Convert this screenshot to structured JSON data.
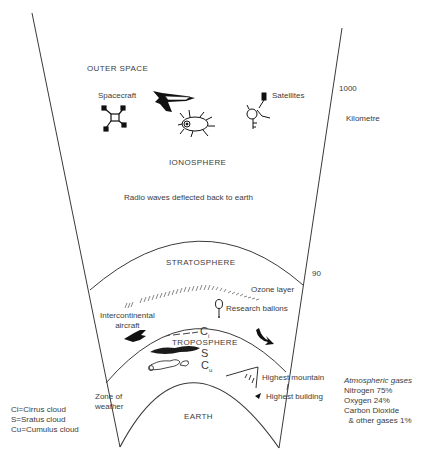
{
  "layers": {
    "outer_space": "OUTER SPACE",
    "ionosphere": "IONOSPHERE",
    "ionosphere_note": "Radio waves deflected back to earth",
    "stratosphere": "STRATOSPHERE",
    "troposphere": "TROPOSPHERE",
    "earth": "EARTH"
  },
  "objects": {
    "spacecraft": "Spacecraft",
    "satellites": "Satellites",
    "ozone_layer": "Ozone layer",
    "research_balloons": "Research ballons",
    "intercontinental_aircraft": "Intercontinental\naircraft",
    "highest_mountain": "Highest mountain",
    "highest_building": "Highest building",
    "zone_of_weather": "Zone of\nweather"
  },
  "clouds": {
    "cirrus_symbol": "C",
    "cirrus_sub": "i",
    "stratus_symbol": "S",
    "cumulus_symbol": "C",
    "cumulus_sub": "u"
  },
  "scale": {
    "top_value": "1000",
    "unit": "Kilometre",
    "stratosphere_value": "90"
  },
  "legend": {
    "items": [
      "Ci=Cirrus cloud",
      "S=Sratus cloud",
      "Cu=Cumulus cloud"
    ]
  },
  "gases": {
    "title": "Atmospheric gases",
    "items": [
      "Nitrogen 75%",
      "Oxygen 24%",
      "Carbon Dioxide",
      "  & other gases 1%"
    ]
  },
  "colors": {
    "line": "#3a3a3a",
    "text": "#3c3c3c",
    "fill": "#111111"
  }
}
